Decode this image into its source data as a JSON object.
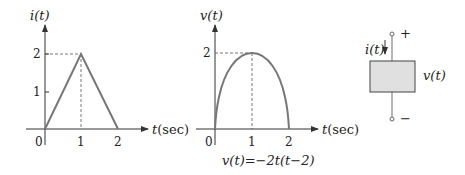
{
  "plot_current": {
    "ylabel": "i(t)",
    "xlabel": "t(sec)",
    "x_ticks": [
      "0",
      "1",
      "2"
    ],
    "y_ticks": [
      "1",
      "2"
    ],
    "points": [
      [
        0,
        0
      ],
      [
        1,
        2
      ],
      [
        2,
        0
      ]
    ]
  },
  "plot_voltage": {
    "ylabel": "v(t)",
    "xlabel": "t(sec)",
    "x_ticks": [
      "0",
      "1",
      "2"
    ],
    "y_ticks": [
      "2"
    ],
    "equation": "v(t)=−2t(t−2)"
  },
  "element": {
    "current_label": "i(t)",
    "voltage_label": "v(t)",
    "plus": "+",
    "minus": "−"
  },
  "colors": {
    "curve": "#777777",
    "axis": "#333333",
    "box_fill": "#e0e0e0"
  }
}
